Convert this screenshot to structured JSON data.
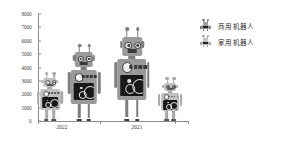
{
  "chart_data": {
    "type": "bar",
    "title": "",
    "subtitle": "",
    "xlabel": "",
    "ylabel": "",
    "ylim": [
      0,
      8000
    ],
    "ytick_step": 1000,
    "grid": false,
    "legend_position": "right",
    "categories": [
      "2022",
      "2021"
    ],
    "yticks": [
      "8000",
      "7000",
      "6000",
      "5000",
      "4000",
      "3000",
      "2000",
      "1000",
      "0"
    ],
    "series": [
      {
        "name": "商用机器人",
        "values": [
          5600,
          6800
        ],
        "color": "#8e8e8e"
      },
      {
        "name": "家用机器人",
        "values": [
          3500,
          3100
        ],
        "color": "#b9b9b9"
      }
    ],
    "annotations": [],
    "glyph": "robot-pictograph"
  },
  "axis": {
    "y_ticks": [
      {
        "label": "8000",
        "value": 8000
      },
      {
        "label": "7000",
        "value": 7000
      },
      {
        "label": "6000",
        "value": 6000
      },
      {
        "label": "5000",
        "value": 5000
      },
      {
        "label": "4000",
        "value": 4000
      },
      {
        "label": "3000",
        "value": 3000
      },
      {
        "label": "2000",
        "value": 2000
      },
      {
        "label": "1000",
        "value": 1000
      },
      {
        "label": "0",
        "value": 0
      }
    ],
    "x_labels": [
      {
        "label": "2022"
      },
      {
        "label": "2021"
      }
    ]
  },
  "legend": {
    "items": [
      {
        "label": "商用机器人",
        "icon": "robot-icon-commercial"
      },
      {
        "label": "家用机器人",
        "icon": "robot-icon-household"
      }
    ]
  },
  "colors": {
    "commercial_light": "#9a9a9a",
    "commercial_mid": "#7e7e7e",
    "commercial_dark": "#3a3a3a",
    "household_light": "#c0c0c0",
    "household_mid": "#a8a8a8",
    "household_dark": "#555555",
    "axis": "#8c8c8c",
    "text": "#3a3a3a"
  }
}
